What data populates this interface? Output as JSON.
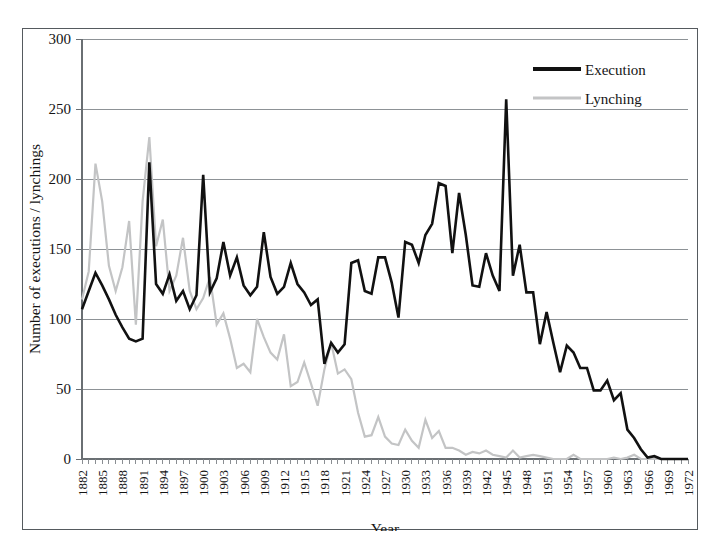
{
  "figure": {
    "background_color": "#ffffff",
    "frame_color": "#555a5e"
  },
  "chart_data": {
    "type": "line",
    "title": "",
    "subtitle": "",
    "xlabel": "Year",
    "ylabel": "Number of executions / lynchings",
    "xlim": [
      1882,
      1972
    ],
    "ylim": [
      0,
      300
    ],
    "yticks": [
      0,
      50,
      100,
      150,
      200,
      250,
      300
    ],
    "xtick_step": 3,
    "xticks": [
      1882,
      1885,
      1888,
      1891,
      1894,
      1897,
      1900,
      1903,
      1906,
      1909,
      1912,
      1915,
      1918,
      1921,
      1924,
      1927,
      1930,
      1933,
      1936,
      1939,
      1942,
      1945,
      1948,
      1951,
      1954,
      1957,
      1960,
      1963,
      1966,
      1969,
      1972
    ],
    "grid": "horizontal",
    "legend_position": "top-right",
    "x": [
      1882,
      1883,
      1884,
      1885,
      1886,
      1887,
      1888,
      1889,
      1890,
      1891,
      1892,
      1893,
      1894,
      1895,
      1896,
      1897,
      1898,
      1899,
      1900,
      1901,
      1902,
      1903,
      1904,
      1905,
      1906,
      1907,
      1908,
      1909,
      1910,
      1911,
      1912,
      1913,
      1914,
      1915,
      1916,
      1917,
      1918,
      1919,
      1920,
      1921,
      1922,
      1923,
      1924,
      1925,
      1926,
      1927,
      1928,
      1929,
      1930,
      1931,
      1932,
      1933,
      1934,
      1935,
      1936,
      1937,
      1938,
      1939,
      1940,
      1941,
      1942,
      1943,
      1944,
      1945,
      1946,
      1947,
      1948,
      1949,
      1950,
      1951,
      1952,
      1953,
      1954,
      1955,
      1956,
      1957,
      1958,
      1959,
      1960,
      1961,
      1962,
      1963,
      1964,
      1965,
      1966,
      1967,
      1968,
      1969,
      1970,
      1971,
      1972
    ],
    "series": [
      {
        "name": "Execution",
        "color": "#111111",
        "line_width": 2.6,
        "line_style": "solid",
        "values": [
          107,
          120,
          133,
          124,
          114,
          103,
          94,
          86,
          84,
          86,
          212,
          125,
          118,
          132,
          113,
          120,
          107,
          117,
          203,
          119,
          129,
          155,
          131,
          144,
          124,
          117,
          123,
          162,
          130,
          118,
          123,
          140,
          125,
          119,
          110,
          114,
          68,
          83,
          76,
          82,
          140,
          142,
          120,
          118,
          144,
          144,
          126,
          101,
          155,
          153,
          140,
          160,
          168,
          197,
          195,
          147,
          190,
          160,
          124,
          123,
          147,
          131,
          120,
          257,
          131,
          153,
          119,
          119,
          82,
          105,
          83,
          62,
          81,
          76,
          65,
          65,
          49,
          49,
          56,
          42,
          47,
          21,
          15,
          7,
          1,
          2,
          0,
          0,
          0,
          0,
          0
        ]
      },
      {
        "name": "Lynching",
        "color": "#c3c4c5",
        "line_width": 2.2,
        "line_style": "solid",
        "values": [
          114,
          134,
          211,
          184,
          138,
          120,
          137,
          170,
          96,
          184,
          230,
          152,
          171,
          120,
          131,
          158,
          120,
          107,
          115,
          130,
          96,
          104,
          86,
          65,
          68,
          62,
          100,
          87,
          76,
          71,
          89,
          52,
          55,
          69,
          54,
          38,
          64,
          83,
          61,
          64,
          57,
          33,
          16,
          17,
          30,
          16,
          11,
          10,
          21,
          13,
          8,
          28,
          15,
          20,
          8,
          8,
          6,
          3,
          5,
          4,
          6,
          3,
          2,
          1,
          6,
          1,
          2,
          3,
          2,
          1,
          0,
          0,
          0,
          3,
          0,
          0,
          0,
          0,
          0,
          1,
          0,
          1,
          3,
          0,
          0,
          0,
          0,
          0,
          0,
          0,
          0
        ]
      }
    ]
  },
  "legend": {
    "items": [
      {
        "label": "Execution",
        "color": "#111111",
        "swatch": "thick-black-line"
      },
      {
        "label": "Lynching",
        "color": "#c3c4c5",
        "swatch": "thin-gray-line"
      }
    ]
  }
}
